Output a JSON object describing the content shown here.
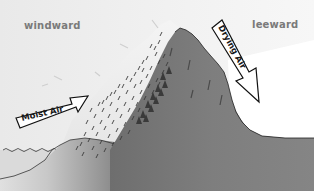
{
  "diagram": {
    "labels": {
      "windward": "windward",
      "leeward": "leeward",
      "moist_air": "Moist Air",
      "drying_air": "Drying Air"
    },
    "colors": {
      "sky_left": "#ececec",
      "sky_right": "#f6f6f6",
      "mountain": "#7d7d7d",
      "mountain_dark": "#6a6a6a",
      "ground": "#8c8c8c",
      "water": "#d8d8d8",
      "clouds": "#f2f2f2",
      "rain": "#3a3a3a",
      "trees": "#3c3c3c",
      "arrow_fill": "#ffffff",
      "arrow_stroke": "#111111",
      "label_text": "#7a7a7a"
    }
  }
}
